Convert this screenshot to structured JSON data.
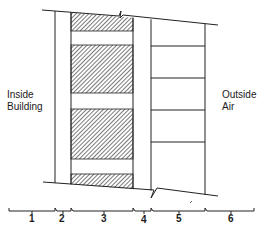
{
  "diagram": {
    "type": "wall-section",
    "labels": {
      "inside": [
        "Inside",
        "Building"
      ],
      "outside": [
        "Outside",
        "Air"
      ]
    },
    "layers": [
      {
        "id": 1,
        "label": "1",
        "description": "Inside air film"
      },
      {
        "id": 2,
        "label": "2",
        "description": "Interior finish"
      },
      {
        "id": 3,
        "label": "3",
        "description": "Hatched block / insulation with gaps"
      },
      {
        "id": 4,
        "label": "4",
        "description": "Air space"
      },
      {
        "id": 5,
        "label": "5",
        "description": "Outer masonry courses"
      },
      {
        "id": 6,
        "label": "6",
        "description": "Outside air film"
      }
    ],
    "colors": {
      "line": "#222222",
      "hatch": "#333333",
      "background": "#ffffff"
    }
  }
}
